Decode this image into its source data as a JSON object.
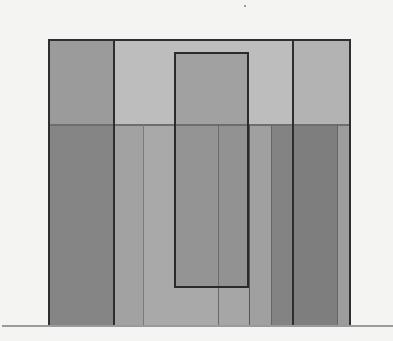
{
  "diagram": {
    "colors": {
      "background": "#f4f4f2",
      "frame_border": "#2e2e2e",
      "upper_left": "#9b9b9b",
      "upper_middle": "#bdbdbd",
      "upper_right": "#b3b3b3",
      "lower_left": "#858585",
      "lower_mid_a": "#a2a2a2",
      "lower_mid_b": "#a9a9a9",
      "lower_center": "#8e8e8e",
      "lower_right_light": "#a0a0a0",
      "lower_right_dark": "#7e7e7e",
      "lower_far_right": "#9c9c9c",
      "inner_rect_fill": "#8f8f8f",
      "baseline": "#9a9a9a"
    },
    "frame": {
      "x": 48,
      "y": 39,
      "width": 303,
      "height": 288
    },
    "horizontal_split_y": 125,
    "inner_rectangle": {
      "x": 174,
      "y": 52,
      "width": 75,
      "height": 236
    },
    "baseline_y": 326
  }
}
